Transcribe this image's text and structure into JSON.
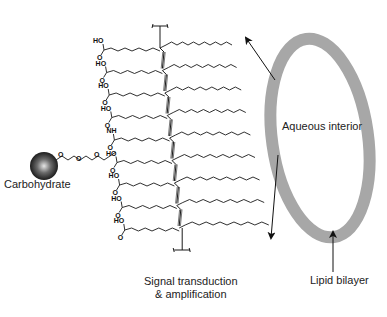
{
  "figure": {
    "type": "schematic"
  },
  "labels": {
    "carbohydrate": "Carbohydrate",
    "aqueous_interior": "Aqueous interior",
    "lipid_bilayer": "Lipid bilayer",
    "signal_line1": "Signal transduction",
    "signal_line2": "& amplification"
  },
  "chemistry": {
    "acid_group_top": "HO",
    "acid_group_bottom": "O",
    "amide_group": "NH",
    "amide_carbonyl": "O",
    "linker_oxygen": "O",
    "acid_rows": 9,
    "amide_row_index": 4
  },
  "colors": {
    "membrane": "#a7a7a7",
    "line": "#1a1a1a",
    "sphere_dark": "#111111",
    "sphere_light": "#d8d8d8",
    "text": "#222222"
  }
}
